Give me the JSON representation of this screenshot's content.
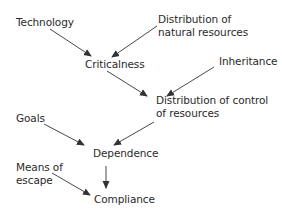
{
  "diagram": {
    "nodes": [
      {
        "id": "technology",
        "label": "Technology"
      },
      {
        "id": "natural",
        "label_line1": "Distribution of",
        "label_line2": "natural resources"
      },
      {
        "id": "criticalness",
        "label": "Criticalness"
      },
      {
        "id": "inheritance",
        "label": "Inheritance"
      },
      {
        "id": "control",
        "label_line1": "Distribution of control",
        "label_line2": "of resources"
      },
      {
        "id": "goals",
        "label": "Goals"
      },
      {
        "id": "dependence",
        "label": "Dependence"
      },
      {
        "id": "escape",
        "label_line1": "Means of",
        "label_line2": "escape"
      },
      {
        "id": "compliance",
        "label": "Compliance"
      }
    ],
    "edges": [
      {
        "from": "technology",
        "to": "criticalness"
      },
      {
        "from": "natural",
        "to": "criticalness"
      },
      {
        "from": "criticalness",
        "to": "control"
      },
      {
        "from": "inheritance",
        "to": "control"
      },
      {
        "from": "goals",
        "to": "dependence"
      },
      {
        "from": "control",
        "to": "dependence"
      },
      {
        "from": "dependence",
        "to": "compliance"
      },
      {
        "from": "escape",
        "to": "compliance"
      }
    ],
    "colors": {
      "text": "#2a2a2a",
      "edge": "#333333"
    }
  }
}
